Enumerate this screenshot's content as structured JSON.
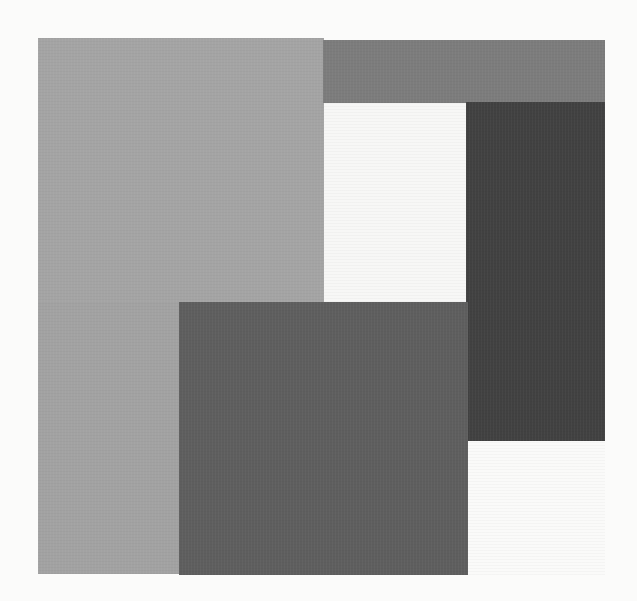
{
  "artwork": {
    "background": "#fbfbfa",
    "blocks": [
      {
        "name": "light-gray-top-left-block",
        "x": 38,
        "y": 38,
        "w": 286,
        "h": 265,
        "color": "#a4a4a4"
      },
      {
        "name": "mid-gray-top-band-block",
        "x": 323,
        "y": 40,
        "w": 282,
        "h": 63,
        "color": "#7c7c7c"
      },
      {
        "name": "white-center-block",
        "x": 324,
        "y": 103,
        "w": 143,
        "h": 199,
        "color": "#f7f7f6"
      },
      {
        "name": "dark-right-block",
        "x": 466,
        "y": 102,
        "w": 139,
        "h": 339,
        "color": "#414141"
      },
      {
        "name": "light-gray-bottom-left-block",
        "x": 38,
        "y": 302,
        "w": 142,
        "h": 272,
        "color": "#a2a2a2"
      },
      {
        "name": "dark-gray-bottom-center-block",
        "x": 179,
        "y": 302,
        "w": 289,
        "h": 273,
        "color": "#5e5e5e"
      },
      {
        "name": "white-bottom-right-block",
        "x": 468,
        "y": 441,
        "w": 137,
        "h": 134,
        "color": "#fafaf9"
      }
    ]
  }
}
